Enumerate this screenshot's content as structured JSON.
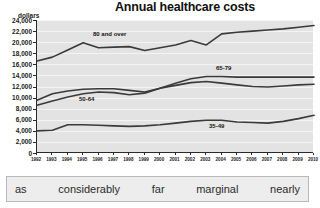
{
  "chart_data": {
    "type": "line",
    "title": "Annual healthcare costs",
    "xlabel": "",
    "ylabel": "dollars",
    "ylim": [
      0,
      24000
    ],
    "ystep": 2000,
    "grid": true,
    "legend_position": "inline-labels",
    "ytick_labels": [
      "24,000",
      "22,000",
      "20,000",
      "18,000",
      "16,000",
      "14,000",
      "12,000",
      "10,000",
      "8,000",
      "6,000",
      "4,000",
      "2,000",
      "0"
    ],
    "categories": [
      "1992",
      "1993",
      "1994",
      "1995",
      "1996",
      "1997",
      "1998",
      "1999",
      "2000",
      "2001",
      "2002",
      "2003",
      "2004",
      "2005",
      "2006",
      "2007",
      "2008",
      "2009",
      "2010"
    ],
    "series": [
      {
        "name": "80 and over",
        "values": [
          16600,
          17300,
          18600,
          19900,
          19000,
          19100,
          19200,
          18500,
          19000,
          19500,
          20300,
          19500,
          21500,
          21800,
          22000,
          22200,
          22400,
          22700,
          23000
        ]
      },
      {
        "name": "65-79",
        "values": [
          8600,
          9400,
          10100,
          10700,
          11000,
          10900,
          10500,
          10800,
          11700,
          12600,
          13400,
          13800,
          13800,
          13700,
          13700,
          13700,
          13700,
          13700,
          13700
        ]
      },
      {
        "name": "50-64",
        "values": [
          9500,
          10700,
          11200,
          11500,
          11600,
          11600,
          11300,
          11000,
          11700,
          12200,
          12700,
          12900,
          12600,
          12300,
          12000,
          11900,
          12100,
          12300,
          12400
        ]
      },
      {
        "name": "35-49",
        "values": [
          4000,
          4100,
          5100,
          5100,
          5000,
          4900,
          4800,
          4900,
          5100,
          5400,
          5700,
          5900,
          5900,
          5600,
          5500,
          5400,
          5700,
          6200,
          6800
        ]
      }
    ],
    "colors": {
      "plot_background": "#e3e3e3",
      "gridline": "#f4f4f4",
      "axis": "#2a2a2a",
      "line": "#3a3a3a"
    }
  },
  "word_bank": {
    "words": [
      "as",
      "considerably",
      "far",
      "marginal",
      "nearly"
    ]
  }
}
